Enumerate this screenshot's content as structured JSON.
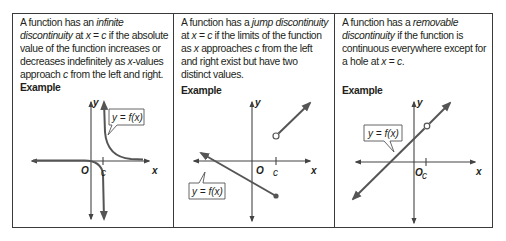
{
  "columns": [
    {
      "type": "infinite",
      "description_parts": [
        "A function has an ",
        "infinite discontinuity",
        " at ",
        "x",
        " = ",
        "c",
        " if the absolute value of the function increases or decreases indefinitely as ",
        "x",
        "-values approach ",
        "c",
        " from the left and right."
      ],
      "example_label": "Example",
      "graph": {
        "y_axis_label": "y",
        "x_axis_label": "x",
        "origin_label": "O",
        "c_label": "c",
        "function_label": "y = f(x)"
      }
    },
    {
      "type": "jump",
      "description_parts": [
        "A function has a ",
        "jump discontinuity",
        " at ",
        "x",
        " = ",
        "c",
        " if the limits of the function as ",
        "x",
        " approaches ",
        "c",
        " from the left and right exist but have two distinct values."
      ],
      "example_label": "Example",
      "graph": {
        "y_axis_label": "y",
        "x_axis_label": "x",
        "origin_label": "O",
        "c_label": "c",
        "function_label": "y = f(x)"
      }
    },
    {
      "type": "removable",
      "description_parts": [
        "A function has a ",
        "removable discontinuity",
        " if the function is continuous everywhere except for a hole at ",
        "x",
        " = ",
        "c",
        "."
      ],
      "example_label": "Example",
      "graph": {
        "y_axis_label": "y",
        "x_axis_label": "x",
        "origin_label": "O",
        "c_label": "c",
        "function_label": "y = f(x)"
      }
    }
  ],
  "colors": {
    "border": "#3a3a3a",
    "curve": "#555555",
    "text": "#231f20"
  }
}
